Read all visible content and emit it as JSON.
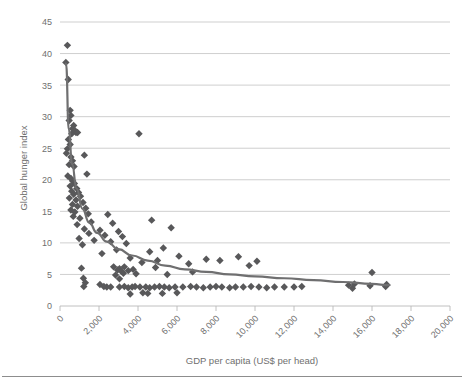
{
  "chart_data": {
    "type": "scatter",
    "title": "",
    "xlabel": "GDP per capita (US$ per head)",
    "ylabel": "Global hunger index",
    "xlim": [
      0,
      20000
    ],
    "ylim": [
      0,
      45
    ],
    "xticks": [
      0,
      2000,
      4000,
      6000,
      8000,
      10000,
      12000,
      14000,
      16000,
      18000,
      20000
    ],
    "xtick_labels": [
      "0",
      "2,000",
      "4,000",
      "6,000",
      "8,000",
      "10,000",
      "12,000",
      "14,000",
      "16,000",
      "18,000",
      "20,000"
    ],
    "yticks": [
      0,
      5,
      10,
      15,
      20,
      25,
      30,
      35,
      40,
      45
    ],
    "ytick_labels": [
      "0",
      "5",
      "10",
      "15",
      "20",
      "25",
      "30",
      "35",
      "40",
      "45"
    ],
    "grid": "horizontal",
    "legend": "none",
    "marker_shape": "diamond",
    "marker_color": "#58585a",
    "trend_color": "#6f6f70",
    "series": [
      {
        "name": "Countries",
        "points": [
          [
            380,
            41.3
          ],
          [
            300,
            38.6
          ],
          [
            420,
            35.9
          ],
          [
            520,
            31.0
          ],
          [
            560,
            30.2
          ],
          [
            470,
            29.4
          ],
          [
            700,
            28.6
          ],
          [
            640,
            28.1
          ],
          [
            760,
            27.8
          ],
          [
            820,
            27.5
          ],
          [
            600,
            27.3
          ],
          [
            900,
            27.5
          ],
          [
            4050,
            27.3
          ],
          [
            430,
            26.4
          ],
          [
            520,
            25.6
          ],
          [
            380,
            24.9
          ],
          [
            330,
            24.2
          ],
          [
            1250,
            23.9
          ],
          [
            560,
            23.6
          ],
          [
            640,
            23.0
          ],
          [
            470,
            22.4
          ],
          [
            720,
            22.1
          ],
          [
            1380,
            20.9
          ],
          [
            400,
            20.6
          ],
          [
            560,
            20.2
          ],
          [
            650,
            19.8
          ],
          [
            740,
            19.4
          ],
          [
            520,
            19.0
          ],
          [
            860,
            18.6
          ],
          [
            600,
            18.2
          ],
          [
            950,
            18.0
          ],
          [
            700,
            17.7
          ],
          [
            1050,
            17.4
          ],
          [
            480,
            17.1
          ],
          [
            820,
            16.8
          ],
          [
            1180,
            16.4
          ],
          [
            640,
            16.1
          ],
          [
            900,
            15.8
          ],
          [
            1320,
            15.5
          ],
          [
            560,
            15.2
          ],
          [
            760,
            14.9
          ],
          [
            1450,
            14.6
          ],
          [
            2450,
            14.5
          ],
          [
            680,
            14.2
          ],
          [
            1020,
            13.9
          ],
          [
            4700,
            13.6
          ],
          [
            1600,
            13.3
          ],
          [
            2700,
            13.1
          ],
          [
            880,
            12.9
          ],
          [
            5700,
            12.4
          ],
          [
            1250,
            12.2
          ],
          [
            2050,
            12.0
          ],
          [
            3000,
            11.8
          ],
          [
            1480,
            11.5
          ],
          [
            2300,
            11.2
          ],
          [
            3200,
            11.0
          ],
          [
            980,
            10.7
          ],
          [
            1750,
            10.4
          ],
          [
            2600,
            10.2
          ],
          [
            3400,
            9.9
          ],
          [
            1150,
            9.7
          ],
          [
            5300,
            9.2
          ],
          [
            2900,
            8.9
          ],
          [
            4600,
            8.6
          ],
          [
            2150,
            8.3
          ],
          [
            6100,
            7.9
          ],
          [
            9150,
            7.8
          ],
          [
            3600,
            7.6
          ],
          [
            7500,
            7.4
          ],
          [
            5000,
            7.2
          ],
          [
            8200,
            7.2
          ],
          [
            10100,
            7.1
          ],
          [
            4200,
            6.9
          ],
          [
            6600,
            6.7
          ],
          [
            9700,
            6.4
          ],
          [
            2750,
            6.2
          ],
          [
            1100,
            6.0
          ],
          [
            3300,
            6.2
          ],
          [
            4900,
            6.1
          ],
          [
            3050,
            5.9
          ],
          [
            3750,
            5.8
          ],
          [
            2950,
            5.7
          ],
          [
            3500,
            5.6
          ],
          [
            3150,
            5.5
          ],
          [
            16000,
            5.3
          ],
          [
            6800,
            5.4
          ],
          [
            3250,
            5.2
          ],
          [
            3900,
            5.1
          ],
          [
            5500,
            5.0
          ],
          [
            2850,
            4.9
          ],
          [
            1200,
            4.4
          ],
          [
            3050,
            4.3
          ],
          [
            1300,
            3.7
          ],
          [
            1220,
            3.1
          ],
          [
            2400,
            3.0
          ],
          [
            2600,
            3.0
          ],
          [
            3050,
            3.0
          ],
          [
            3300,
            3.1
          ],
          [
            3500,
            2.9
          ],
          [
            3700,
            3.0
          ],
          [
            3850,
            3.1
          ],
          [
            4100,
            3.0
          ],
          [
            4400,
            3.0
          ],
          [
            4600,
            2.9
          ],
          [
            4850,
            3.0
          ],
          [
            5100,
            3.1
          ],
          [
            5350,
            3.0
          ],
          [
            5600,
            2.9
          ],
          [
            5900,
            3.0
          ],
          [
            6300,
            3.0
          ],
          [
            6700,
            3.1
          ],
          [
            7000,
            3.0
          ],
          [
            7350,
            2.9
          ],
          [
            7700,
            3.0
          ],
          [
            8000,
            3.1
          ],
          [
            8300,
            3.0
          ],
          [
            8700,
            2.9
          ],
          [
            9000,
            3.0
          ],
          [
            9400,
            3.0
          ],
          [
            9800,
            3.1
          ],
          [
            10200,
            3.0
          ],
          [
            10600,
            2.9
          ],
          [
            11000,
            3.0
          ],
          [
            11500,
            3.0
          ],
          [
            12000,
            3.0
          ],
          [
            12400,
            3.1
          ],
          [
            14800,
            3.3
          ],
          [
            15000,
            2.8
          ],
          [
            15100,
            3.5
          ],
          [
            15900,
            3.2
          ],
          [
            16700,
            3.1
          ],
          [
            16750,
            3.4
          ],
          [
            3600,
            1.9
          ],
          [
            4250,
            2.1
          ],
          [
            4500,
            2.0
          ],
          [
            5250,
            2.0
          ],
          [
            6000,
            2.1
          ],
          [
            2050,
            3.4
          ],
          [
            2250,
            3.1
          ]
        ]
      }
    ],
    "trendline": {
      "name": "Power trend",
      "points": [
        [
          310,
          38.4
        ],
        [
          450,
          28.0
        ],
        [
          620,
          22.5
        ],
        [
          850,
          18.6
        ],
        [
          1150,
          15.4
        ],
        [
          1500,
          13.2
        ],
        [
          1900,
          11.6
        ],
        [
          2400,
          10.2
        ],
        [
          3000,
          9.0
        ],
        [
          3700,
          8.0
        ],
        [
          4500,
          7.2
        ],
        [
          5400,
          6.4
        ],
        [
          6400,
          5.8
        ],
        [
          7500,
          5.4
        ],
        [
          8700,
          5.0
        ],
        [
          10000,
          4.7
        ],
        [
          11500,
          4.4
        ],
        [
          13000,
          4.1
        ],
        [
          14500,
          3.8
        ],
        [
          16000,
          3.5
        ],
        [
          16900,
          3.3
        ]
      ]
    }
  }
}
